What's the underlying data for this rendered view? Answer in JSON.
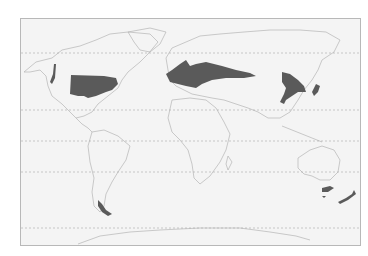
{
  "map": {
    "type": "world distribution map",
    "projection": "equirectangular",
    "background": "#f4f4f4",
    "land_outline_color": "#b0b0b0",
    "region_fill_color": "#5a5a5a",
    "latitude_lines": [
      {
        "name": "arctic-circle",
        "y": 53
      },
      {
        "name": "tropic-of-cancer",
        "y": 110
      },
      {
        "name": "equator",
        "y": 141
      },
      {
        "name": "tropic-of-capricorn",
        "y": 172
      },
      {
        "name": "antarctic-circle",
        "y": 228
      }
    ],
    "shaded_regions": [
      "eastern-north-america",
      "pacific-northwest-coast",
      "europe-western-asia",
      "east-asia-china",
      "japan",
      "southern-chile",
      "southeast-australia-tasmania",
      "new-zealand"
    ]
  }
}
